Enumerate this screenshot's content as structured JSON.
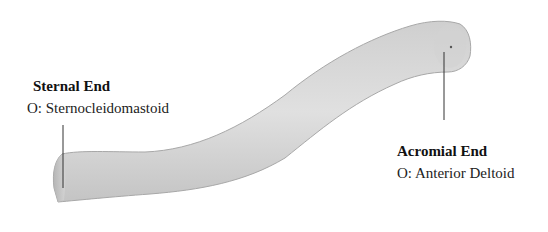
{
  "figure": {
    "colors": {
      "background": "#ffffff",
      "bone_fill": "#d9d9d9",
      "bone_shade": "#b8b8b8",
      "bone_edge": "#9a9a9a",
      "leader_line": "#333333",
      "text": "#1a1a1a"
    }
  },
  "labels": {
    "sternal": {
      "title": "Sternal End",
      "origin": "O: Sternocleidomastoid"
    },
    "acromial": {
      "title": "Acromial End",
      "origin": "O: Anterior Deltoid"
    }
  }
}
